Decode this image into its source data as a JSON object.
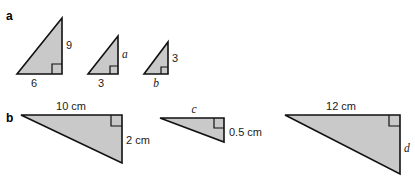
{
  "figure": {
    "background_color": "#ffffff",
    "fill_color": "#c9c9c9",
    "stroke_color": "#111111",
    "parts": [
      {
        "key": "a",
        "label": "a",
        "triangles": [
          {
            "name": "triangle-a-1",
            "vertical_label": "9",
            "vertical_label_type": "number",
            "horizontal_label": "6",
            "horizontal_label_type": "number",
            "right_angle": true
          },
          {
            "name": "triangle-a-2",
            "vertical_label": "a",
            "vertical_label_type": "variable",
            "horizontal_label": "3",
            "horizontal_label_type": "number",
            "right_angle": true
          },
          {
            "name": "triangle-a-3",
            "vertical_label": "3",
            "vertical_label_type": "number",
            "horizontal_label": "b",
            "horizontal_label_type": "variable",
            "right_angle": true
          }
        ]
      },
      {
        "key": "b",
        "label": "b",
        "triangles": [
          {
            "name": "triangle-b-1",
            "top_label": "10 cm",
            "top_label_type": "number",
            "vertical_label": "2 cm",
            "vertical_label_type": "number",
            "right_angle": true
          },
          {
            "name": "triangle-b-2",
            "top_label": "c",
            "top_label_type": "variable",
            "vertical_label": "0.5 cm",
            "vertical_label_type": "number",
            "right_angle": true
          },
          {
            "name": "triangle-b-3",
            "top_label": "12 cm",
            "top_label_type": "number",
            "vertical_label": "d",
            "vertical_label_type": "variable",
            "right_angle": true
          }
        ]
      }
    ]
  }
}
